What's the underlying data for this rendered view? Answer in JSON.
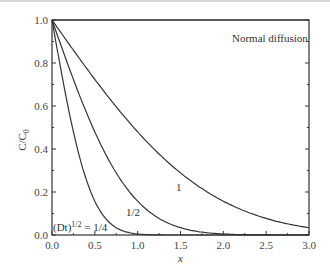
{
  "chart_data": {
    "type": "line",
    "title": "",
    "annotation": "Normal diffusion",
    "xlabel": "x",
    "ylabel": "C/C0",
    "xlim": [
      0,
      3.0
    ],
    "ylim": [
      0,
      1.0
    ],
    "xticks": [
      "0.0",
      "0.5",
      "1.0",
      "1.5",
      "2.0",
      "2.5",
      "3.0"
    ],
    "yticks": [
      "0.0",
      "0.2",
      "0.4",
      "0.6",
      "0.8",
      "1.0"
    ],
    "grid": false,
    "function": "C/C0 = erfc(x / (2 (Dt)^1/2))",
    "series": [
      {
        "name": "(Dt)^1/2 = 1/4",
        "sqrtDt": 0.25,
        "label": "(Dt)1/2 = 1/4",
        "x": [
          0,
          0.1,
          0.2,
          0.3,
          0.4,
          0.5,
          0.6,
          0.8,
          1.0,
          1.5
        ],
        "values": [
          1.0,
          0.78,
          0.57,
          0.4,
          0.26,
          0.16,
          0.09,
          0.02,
          0.005,
          0.0
        ]
      },
      {
        "name": "1/2",
        "sqrtDt": 0.5,
        "label": "1/2",
        "x": [
          0,
          0.25,
          0.5,
          0.75,
          1.0,
          1.25,
          1.5,
          2.0,
          2.5
        ],
        "values": [
          1.0,
          0.72,
          0.48,
          0.29,
          0.16,
          0.08,
          0.03,
          0.005,
          0.0
        ]
      },
      {
        "name": "1",
        "sqrtDt": 1.0,
        "label": "1",
        "x": [
          0,
          0.5,
          1.0,
          1.5,
          2.0,
          2.5,
          3.0
        ],
        "values": [
          1.0,
          0.72,
          0.48,
          0.29,
          0.16,
          0.08,
          0.03
        ]
      },
      {
        "name": "top",
        "label": "",
        "x": [
          0,
          3.0
        ],
        "values": [
          1.0,
          1.0
        ]
      }
    ]
  },
  "labels": {
    "annotation": "Normal diffusion",
    "xlabel": "x",
    "ylabel_main": "C/C",
    "ylabel_sub": "0",
    "curve_1": "1",
    "curve_half": "1/2",
    "curve_quarter_prefix": "(Dt)",
    "curve_quarter_sup": "1/2",
    "curve_quarter_suffix": " = 1/4"
  }
}
